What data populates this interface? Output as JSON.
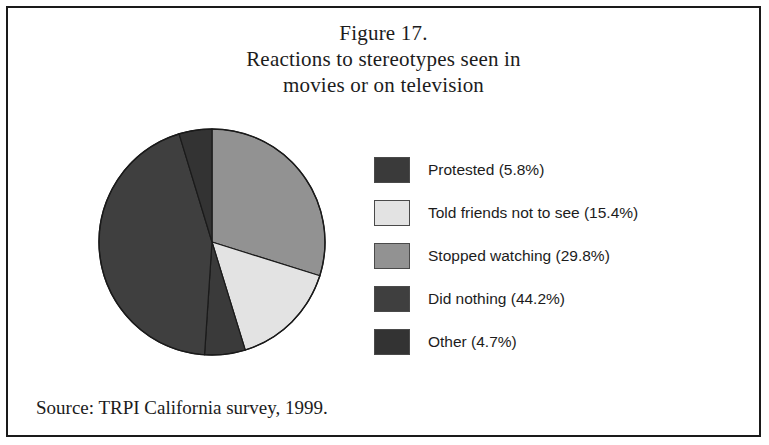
{
  "figure": {
    "title_lines": [
      "Figure 17.",
      "Reactions to stereotypes seen in",
      "movies or on television"
    ],
    "source": "Source: TRPI California survey, 1999."
  },
  "legend": {
    "items": [
      {
        "label": "Protested (5.8%)",
        "color": "#3a3a3a"
      },
      {
        "label": "Told friends not to see (15.4%)",
        "color": "#e3e3e3"
      },
      {
        "label": "Stopped watching (29.8%)",
        "color": "#929292"
      },
      {
        "label": "Did nothing (44.2%)",
        "color": "#3f3f3f"
      },
      {
        "label": "Other (4.7%)",
        "color": "#333333"
      }
    ]
  },
  "chart_data": {
    "type": "pie",
    "title": "Figure 17. Reactions to stereotypes seen in movies or on television",
    "source": "Source: TRPI California survey, 1999.",
    "unit": "percent",
    "start_angle_deg": 0,
    "direction": "clockwise",
    "legend_position": "right",
    "grid": false,
    "categories": [
      "Protested",
      "Told friends not to see",
      "Stopped watching",
      "Did nothing",
      "Other"
    ],
    "values": [
      5.8,
      15.4,
      29.8,
      44.2,
      4.7
    ],
    "labels": [
      "Protested (5.8%)",
      "Told friends not to see (15.4%)",
      "Stopped watching (29.8%)",
      "Did nothing (44.2%)",
      "Other (4.7%)"
    ],
    "colors": [
      "#3a3a3a",
      "#e3e3e3",
      "#929292",
      "#3f3f3f",
      "#333333"
    ],
    "draw_order_clockwise_from_12": [
      {
        "category": "Stopped watching",
        "value": 29.8,
        "color": "#929292"
      },
      {
        "category": "Told friends not to see",
        "value": 15.4,
        "color": "#e3e3e3"
      },
      {
        "category": "Protested",
        "value": 5.8,
        "color": "#3a3a3a"
      },
      {
        "category": "Did nothing",
        "value": 44.2,
        "color": "#3f3f3f"
      },
      {
        "category": "Other",
        "value": 4.7,
        "color": "#333333"
      }
    ],
    "geometry": {
      "cx": 118,
      "cy": 126,
      "r": 113,
      "stroke": "#1a1a1a"
    }
  }
}
